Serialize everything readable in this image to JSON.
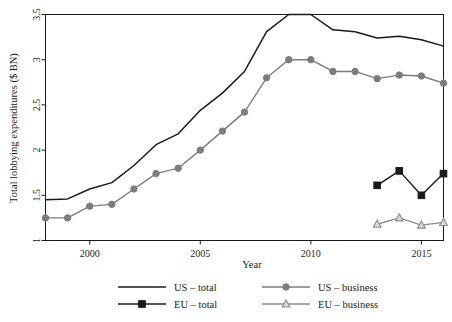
{
  "chart_data": {
    "type": "line",
    "title": "",
    "xlabel": "Year",
    "ylabel": "Total lobbying expenditures ($ BN)",
    "xlim": [
      1998,
      2016
    ],
    "ylim": [
      1,
      3.5
    ],
    "xticks": [
      2000,
      2005,
      2010,
      2015
    ],
    "yticks": [
      1,
      1.5,
      2,
      2.5,
      3,
      3.5
    ],
    "ytick_labels": [
      "1",
      "1.5",
      "2",
      "2.5",
      "3",
      "3.5"
    ],
    "xtick_labels": [
      "2000",
      "2005",
      "2010",
      "2015"
    ],
    "grid": false,
    "legend_position": "bottom",
    "series": [
      {
        "name": "US – total",
        "color": "#1a1a1a",
        "marker": "none",
        "x": [
          1998,
          1999,
          2000,
          2001,
          2002,
          2003,
          2004,
          2005,
          2006,
          2007,
          2008,
          2009,
          2010,
          2011,
          2012,
          2013,
          2014,
          2015,
          2016
        ],
        "values": [
          1.45,
          1.46,
          1.57,
          1.64,
          1.83,
          2.06,
          2.18,
          2.44,
          2.63,
          2.87,
          3.31,
          3.5,
          3.5,
          3.33,
          3.31,
          3.24,
          3.26,
          3.22,
          3.15
        ]
      },
      {
        "name": "US – business",
        "color": "#7d7d7d",
        "marker": "circle",
        "x": [
          1998,
          1999,
          2000,
          2001,
          2002,
          2003,
          2004,
          2005,
          2006,
          2007,
          2008,
          2009,
          2010,
          2011,
          2012,
          2013,
          2014,
          2015,
          2016
        ],
        "values": [
          1.25,
          1.25,
          1.38,
          1.4,
          1.57,
          1.74,
          1.8,
          2.0,
          2.21,
          2.42,
          2.8,
          3.0,
          3.0,
          2.87,
          2.87,
          2.79,
          2.83,
          2.82,
          2.74
        ]
      },
      {
        "name": "EU – total",
        "color": "#1a1a1a",
        "marker": "square",
        "x": [
          2013,
          2014,
          2015,
          2016
        ],
        "values": [
          1.61,
          1.77,
          1.5,
          1.74
        ]
      },
      {
        "name": "EU – business",
        "color": "#8d8d8d",
        "marker": "triangle",
        "x": [
          2013,
          2014,
          2015,
          2016
        ],
        "values": [
          1.18,
          1.25,
          1.17,
          1.2
        ]
      }
    ]
  },
  "legend": {
    "entries": [
      {
        "label": "US – total",
        "key": "us-total"
      },
      {
        "label": "EU – total",
        "key": "eu-total"
      },
      {
        "label": "US – business",
        "key": "us-business"
      },
      {
        "label": "EU – business",
        "key": "eu-business"
      }
    ]
  },
  "axes": {
    "x_title": "Year",
    "y_title": "Total lobbying expenditures ($ BN)"
  }
}
